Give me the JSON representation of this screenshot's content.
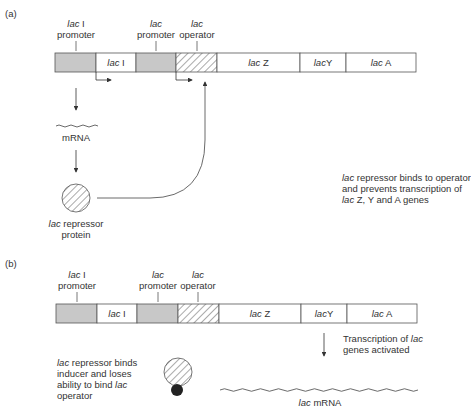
{
  "colors": {
    "promoter_fill": "#c8c8c8",
    "stroke": "#555555",
    "text": "#333333",
    "inducer": "#222222"
  },
  "panel_a": {
    "label": "(a)",
    "top_labels": {
      "laci_promoter": {
        "italic": "lac",
        "rest": " I",
        "line2": "promoter"
      },
      "lac_promoter": {
        "italic": "lac",
        "line2": "promoter"
      },
      "lac_operator": {
        "italic": "lac",
        "line2": "operator"
      }
    },
    "segments": [
      {
        "id": "laci-promoter",
        "type": "promoter",
        "italic": "",
        "rest": ""
      },
      {
        "id": "laci-gene",
        "type": "gene",
        "italic": "lac",
        "rest": " I"
      },
      {
        "id": "lac-promoter",
        "type": "promoter",
        "italic": "",
        "rest": ""
      },
      {
        "id": "lac-operator",
        "type": "operator",
        "italic": "",
        "rest": ""
      },
      {
        "id": "lacz",
        "type": "gene",
        "italic": "lac",
        "rest": " Z"
      },
      {
        "id": "lacy",
        "type": "gene",
        "italic": "lac",
        "rest": "Y"
      },
      {
        "id": "laca",
        "type": "gene",
        "italic": "lac",
        "rest": " A"
      }
    ],
    "mrna_label": "mRNA",
    "repressor_label": {
      "italic": "lac",
      "rest": " repressor",
      "line2": "protein"
    },
    "note": {
      "line1_italic": "lac",
      "line1_rest": " repressor binds to operator",
      "line2": "and prevents transcription of",
      "line3_italic": "lac",
      "line3_rest": " Z, Y and A genes"
    }
  },
  "panel_b": {
    "label": "(b)",
    "top_labels": {
      "laci_promoter": {
        "italic": "lac",
        "rest": " I",
        "line2": "promoter"
      },
      "lac_promoter": {
        "italic": "lac",
        "line2": "promoter"
      },
      "lac_operator": {
        "italic": "lac",
        "line2": "operator"
      }
    },
    "segments": [
      {
        "id": "laci-promoter",
        "type": "promoter",
        "italic": "",
        "rest": ""
      },
      {
        "id": "laci-gene",
        "type": "gene",
        "italic": "lac",
        "rest": " I"
      },
      {
        "id": "lac-promoter",
        "type": "promoter",
        "italic": "",
        "rest": ""
      },
      {
        "id": "lac-operator",
        "type": "operator",
        "italic": "",
        "rest": ""
      },
      {
        "id": "lacz",
        "type": "gene",
        "italic": "lac",
        "rest": " Z"
      },
      {
        "id": "lacy",
        "type": "gene",
        "italic": "lac",
        "rest": "Y"
      },
      {
        "id": "laca",
        "type": "gene",
        "italic": "lac",
        "rest": " A"
      }
    ],
    "transcription_note": {
      "line1_rest": "Transcription of ",
      "line1_italic": "lac",
      "line2": "genes activated"
    },
    "inducer_note": {
      "line1_italic": "lac",
      "line1_rest": " repressor binds",
      "line2": "inducer and loses",
      "line3_rest": "ability to bind ",
      "line3_italic": "lac",
      "line4": "operator"
    },
    "mrna_label": {
      "italic": "lac",
      "rest": " mRNA"
    }
  }
}
